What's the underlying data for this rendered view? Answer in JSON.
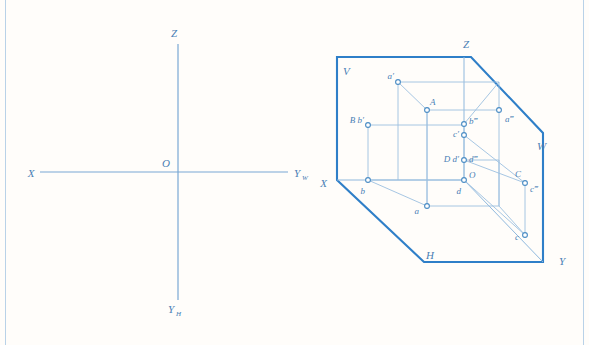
{
  "figure": {
    "type": "engineering-drawing",
    "colors": {
      "background": "#fffdfa",
      "heavy_stroke": "#2f7fc8",
      "light_stroke": "#8fb8dd",
      "axis_stroke": "#7aa8d4",
      "label_fill": "#4a7fb5",
      "rule_stroke": "#b9d2e8"
    }
  },
  "left_diagram": {
    "name": "planar-axis-cross",
    "origin": {
      "x": 178,
      "y": 172
    },
    "axes": [
      {
        "id": "x-axis",
        "label": "X",
        "label_x": 31,
        "label_y": 176,
        "x1": 40,
        "y1": 172,
        "x2": 288,
        "y2": 172
      },
      {
        "id": "yw-axis",
        "label": "Y",
        "sub": "W",
        "label_x": 294,
        "label_y": 176,
        "x1": 178,
        "y1": 172,
        "x2": 288,
        "y2": 172
      },
      {
        "id": "z-axis",
        "label": "Z",
        "label_x": 174,
        "label_y": 37,
        "x1": 178,
        "y1": 44,
        "x2": 178,
        "y2": 172
      },
      {
        "id": "yh-axis",
        "label": "Y",
        "sub": "H",
        "label_x": 171,
        "label_y": 312,
        "x1": 178,
        "y1": 172,
        "x2": 178,
        "y2": 300
      }
    ],
    "origin_label": "O",
    "origin_label_x": 170,
    "origin_label_y": 167
  },
  "right_diagram": {
    "name": "spatial-projection-box",
    "planes": [
      {
        "id": "plane-v",
        "label": "V",
        "label_x": 343,
        "label_y": 72
      },
      {
        "id": "plane-w",
        "label": "W",
        "label_x": 538,
        "label_y": 147
      },
      {
        "id": "plane-h",
        "label": "H",
        "label_x": 428,
        "label_y": 257
      }
    ],
    "axis_labels": [
      {
        "id": "axis-x",
        "label": "X",
        "label_x": 326,
        "label_y": 186
      },
      {
        "id": "axis-y",
        "label": "Y",
        "label_x": 561,
        "label_y": 262
      },
      {
        "id": "axis-z",
        "label": "Z",
        "label_x": 466,
        "label_y": 47
      }
    ],
    "outline_points": "337,180 337,57 471,57 543,133 543,262 424,262",
    "points": [
      {
        "id": "pt-a-prime",
        "label": "a′",
        "cx": 398,
        "cy": 82,
        "lx": 384,
        "ly": 80,
        "kind": "V-projection"
      },
      {
        "id": "pt-A",
        "label": "A",
        "cx": 427,
        "cy": 110,
        "lx": 432,
        "ly": 105,
        "kind": "space-point"
      },
      {
        "id": "pt-a-dprime",
        "label": "a‴",
        "cx": 499,
        "cy": 110,
        "lx": 506,
        "ly": 121,
        "kind": "W-projection"
      },
      {
        "id": "pt-a",
        "label": "a",
        "cx": 427,
        "cy": 206,
        "lx": 417,
        "ly": 212,
        "kind": "H-projection"
      },
      {
        "id": "pt-Bb-prime",
        "label": "B b′",
        "cx": 368,
        "cy": 125,
        "lx": 340,
        "ly": 123,
        "kind": "V-projection"
      },
      {
        "id": "pt-b-dprime",
        "label": "b‴",
        "cx": 464,
        "cy": 124,
        "lx": 470,
        "ly": 123,
        "kind": "W-projection"
      },
      {
        "id": "pt-b",
        "label": "b",
        "cx": 368,
        "cy": 180,
        "lx": 362,
        "ly": 193,
        "kind": "H-projection"
      },
      {
        "id": "pt-c-prime",
        "label": "c′",
        "cx": 464,
        "cy": 135,
        "lx": 451,
        "ly": 136,
        "kind": "V-projection"
      },
      {
        "id": "pt-C",
        "label": "C",
        "cx": 525,
        "cy": 183,
        "lx": 525,
        "ly": 178,
        "kind": "space-point"
      },
      {
        "id": "pt-c-dprime",
        "label": "c‴",
        "cx": 525,
        "cy": 183,
        "lx": 532,
        "ly": 191,
        "kind": "W-projection"
      },
      {
        "id": "pt-c",
        "label": "c",
        "cx": 525,
        "cy": 235,
        "lx": 513,
        "ly": 239,
        "kind": "H-projection"
      },
      {
        "id": "pt-Dd-prime",
        "label": "D d′",
        "cx": 464,
        "cy": 160,
        "lx": 434,
        "ly": 159,
        "kind": "V-projection"
      },
      {
        "id": "pt-d-dprime",
        "label": "d‴",
        "cx": 464,
        "cy": 160,
        "lx": 470,
        "ly": 159,
        "kind": "W-projection"
      },
      {
        "id": "pt-O",
        "label": "O",
        "cx": 464,
        "cy": 180,
        "lx": 470,
        "ly": 176,
        "kind": "origin"
      },
      {
        "id": "pt-d",
        "label": "d",
        "cx": 464,
        "cy": 180,
        "lx": 459,
        "ly": 193,
        "kind": "H-projection"
      }
    ]
  }
}
